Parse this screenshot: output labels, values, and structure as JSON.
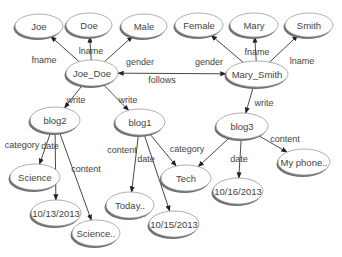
{
  "diagram": {
    "type": "graph",
    "nodes": [
      {
        "id": "joe",
        "label": "Joe",
        "x": 39,
        "y": 26,
        "rx": 24,
        "ry": 12
      },
      {
        "id": "doe",
        "label": "Doe",
        "x": 89,
        "y": 25,
        "rx": 23,
        "ry": 12
      },
      {
        "id": "male",
        "label": "Male",
        "x": 144,
        "y": 26,
        "rx": 23,
        "ry": 12
      },
      {
        "id": "joe_doe",
        "label": "Joe_Doe",
        "x": 92,
        "y": 73,
        "rx": 26,
        "ry": 13
      },
      {
        "id": "female",
        "label": "Female",
        "x": 199,
        "y": 25,
        "rx": 24,
        "ry": 12
      },
      {
        "id": "mary",
        "label": "Mary",
        "x": 254,
        "y": 25,
        "rx": 24,
        "ry": 12
      },
      {
        "id": "smith",
        "label": "Smith",
        "x": 309,
        "y": 25,
        "rx": 24,
        "ry": 12
      },
      {
        "id": "mary_smith",
        "label": "Mary_Smith",
        "x": 257,
        "y": 74,
        "rx": 31,
        "ry": 13
      },
      {
        "id": "blog2",
        "label": "blog2",
        "x": 55,
        "y": 120,
        "rx": 25,
        "ry": 13
      },
      {
        "id": "blog1",
        "label": "blog1",
        "x": 140,
        "y": 122,
        "rx": 25,
        "ry": 13
      },
      {
        "id": "blog3",
        "label": "blog3",
        "x": 242,
        "y": 126,
        "rx": 26,
        "ry": 13
      },
      {
        "id": "science",
        "label": "Science",
        "x": 35,
        "y": 177,
        "rx": 25,
        "ry": 13
      },
      {
        "id": "date1013",
        "label": "10/13/2013",
        "x": 56,
        "y": 213,
        "rx": 25,
        "ry": 13
      },
      {
        "id": "science_content",
        "label": "Science..",
        "x": 96,
        "y": 233,
        "rx": 24,
        "ry": 13
      },
      {
        "id": "today",
        "label": "Today..",
        "x": 130,
        "y": 205,
        "rx": 24,
        "ry": 13
      },
      {
        "id": "date1015",
        "label": "10/15/2013",
        "x": 174,
        "y": 224,
        "rx": 25,
        "ry": 13
      },
      {
        "id": "tech",
        "label": "Tech",
        "x": 186,
        "y": 178,
        "rx": 25,
        "ry": 13
      },
      {
        "id": "date1016",
        "label": "10/16/2013",
        "x": 238,
        "y": 191,
        "rx": 25,
        "ry": 13
      },
      {
        "id": "myphone",
        "label": "My phone..",
        "x": 304,
        "y": 162,
        "rx": 26,
        "ry": 13
      }
    ],
    "edges": [
      {
        "from": "joe_doe",
        "to": "joe",
        "label": "fname",
        "lx": 44,
        "ly": 60
      },
      {
        "from": "joe_doe",
        "to": "doe",
        "label": "lname",
        "lx": 91,
        "ly": 51
      },
      {
        "from": "joe_doe",
        "to": "male",
        "label": "gender",
        "lx": 140,
        "ly": 62
      },
      {
        "from": "joe_doe",
        "to": "blog2",
        "label": "write",
        "lx": 76,
        "ly": 100
      },
      {
        "from": "joe_doe",
        "to": "blog1",
        "label": "write",
        "lx": 128,
        "ly": 100
      },
      {
        "from": "mary_smith",
        "to": "joe_doe",
        "label": "follows",
        "lx": 162,
        "ly": 80,
        "bidirectional": true
      },
      {
        "from": "mary_smith",
        "to": "female",
        "label": "gender",
        "lx": 209,
        "ly": 62
      },
      {
        "from": "mary_smith",
        "to": "mary",
        "label": "fname",
        "lx": 257,
        "ly": 52
      },
      {
        "from": "mary_smith",
        "to": "smith",
        "label": "lname",
        "lx": 302,
        "ly": 61
      },
      {
        "from": "mary_smith",
        "to": "blog3",
        "label": "write",
        "lx": 264,
        "ly": 103
      },
      {
        "from": "blog2",
        "to": "science",
        "label": "category",
        "lx": 22,
        "ly": 145
      },
      {
        "from": "blog2",
        "to": "date1013",
        "label": "date",
        "lx": 50,
        "ly": 146
      },
      {
        "from": "blog2",
        "to": "science_content",
        "label": "content",
        "lx": 86,
        "ly": 169
      },
      {
        "from": "blog1",
        "to": "today",
        "label": "content",
        "lx": 122,
        "ly": 150
      },
      {
        "from": "blog1",
        "to": "date1015",
        "label": "date",
        "lx": 146,
        "ly": 159
      },
      {
        "from": "blog1",
        "to": "tech",
        "label": "category",
        "lx": 187,
        "ly": 149
      },
      {
        "from": "blog3",
        "to": "tech",
        "label": "category",
        "lx": 0,
        "ly": 0,
        "hide_label": true
      },
      {
        "from": "blog3",
        "to": "date1016",
        "label": "date",
        "lx": 239,
        "ly": 159
      },
      {
        "from": "blog3",
        "to": "myphone",
        "label": "content",
        "lx": 285,
        "ly": 139
      }
    ]
  }
}
